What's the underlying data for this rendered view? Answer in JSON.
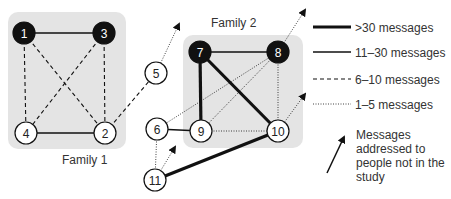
{
  "families": [
    {
      "id": "family-1",
      "label": "Family 1",
      "box": {
        "x": 8,
        "y": 12,
        "w": 118,
        "h": 137
      },
      "label_pos": {
        "x": 62,
        "y": 164
      }
    },
    {
      "id": "family-2",
      "label": "Family 2",
      "box": {
        "x": 183,
        "y": 35,
        "w": 120,
        "h": 113
      },
      "label_pos": {
        "x": 211,
        "y": 27
      }
    }
  ],
  "nodes": [
    {
      "id": "1",
      "x": 24,
      "y": 33,
      "filled": true
    },
    {
      "id": "3",
      "x": 104,
      "y": 33,
      "filled": true
    },
    {
      "id": "4",
      "x": 26,
      "y": 133,
      "filled": false
    },
    {
      "id": "2",
      "x": 105,
      "y": 133,
      "filled": false
    },
    {
      "id": "5",
      "x": 156,
      "y": 73,
      "filled": false
    },
    {
      "id": "7",
      "x": 200,
      "y": 52,
      "filled": true
    },
    {
      "id": "8",
      "x": 278,
      "y": 52,
      "filled": true
    },
    {
      "id": "6",
      "x": 157,
      "y": 129,
      "filled": false
    },
    {
      "id": "9",
      "x": 201,
      "y": 131,
      "filled": false
    },
    {
      "id": "10",
      "x": 278,
      "y": 131,
      "filled": false
    },
    {
      "id": "11",
      "x": 155,
      "y": 180,
      "filled": false
    }
  ],
  "edges": [
    {
      "from": "1",
      "to": "3",
      "weight": "11-30"
    },
    {
      "from": "1",
      "to": "4",
      "weight": "6-10"
    },
    {
      "from": "1",
      "to": "2",
      "weight": "6-10"
    },
    {
      "from": "3",
      "to": "4",
      "weight": "6-10"
    },
    {
      "from": "3",
      "to": "2",
      "weight": "6-10"
    },
    {
      "from": "4",
      "to": "2",
      "weight": "11-30"
    },
    {
      "from": "2",
      "to": "5",
      "weight": "6-10"
    },
    {
      "from": "7",
      "to": "8",
      "weight": "11-30"
    },
    {
      "from": "7",
      "to": "9",
      "weight": ">30"
    },
    {
      "from": "7",
      "to": "10",
      "weight": ">30"
    },
    {
      "from": "8",
      "to": "9",
      "weight": "1-5"
    },
    {
      "from": "8",
      "to": "6",
      "weight": "1-5"
    },
    {
      "from": "8",
      "to": "10",
      "weight": "1-5"
    },
    {
      "from": "9",
      "to": "10",
      "weight": "1-5"
    },
    {
      "from": "6",
      "to": "9",
      "weight": "11-30"
    },
    {
      "from": "6",
      "to": "11",
      "weight": "1-5"
    },
    {
      "from": "11",
      "to": "10",
      "weight": ">30"
    }
  ],
  "external_arrows": [
    {
      "from": "5",
      "to": {
        "x": 179,
        "y": 24
      }
    },
    {
      "from": "8",
      "to": {
        "x": 305,
        "y": 10
      }
    },
    {
      "from": "10",
      "to": {
        "x": 305,
        "y": 94
      }
    },
    {
      "from": "11",
      "to": {
        "x": 175,
        "y": 147
      }
    }
  ],
  "legend": {
    "items": [
      {
        "key": ">30",
        "label": ">30 messages",
        "y": 27
      },
      {
        "key": "11-30",
        "label": "11–30 messages",
        "y": 52
      },
      {
        "key": "6-10",
        "label": "6–10 messages",
        "y": 79
      },
      {
        "key": "1-5",
        "label": "1–5 messages",
        "y": 104
      }
    ],
    "arrow_note": {
      "lines": [
        "Messages",
        "addressed to",
        "people not in the",
        "study"
      ]
    }
  },
  "styles": {
    "box_fill": "#e4e4e4",
    "node_fill_dark": "#111111",
    "node_fill_light": "#ffffff",
    "edge_color": "#111111"
  }
}
